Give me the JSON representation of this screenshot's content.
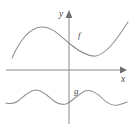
{
  "figure": {
    "background_color": "#ffffff",
    "axis_color": "#8a8a8a",
    "curve_color": "#8f8f8f",
    "label_color": "#4a4a4a",
    "axes": {
      "x_axis_label": "x",
      "y_axis_label": "y",
      "origin_x": 69,
      "origin_y": 70,
      "x_axis_y": 70,
      "x_axis_start": 6,
      "x_axis_end": 126,
      "y_axis_x": 69,
      "y_axis_start": 10,
      "y_axis_end": 124,
      "x_arrow": "right",
      "y_arrow": "up",
      "gridlines": false,
      "tick_labels": []
    },
    "labels": {
      "f_label": "f",
      "f_label_x": 78,
      "f_label_y": 38,
      "g_label": "g",
      "g_label_x": 74,
      "g_label_y": 94,
      "x_label_x": 121,
      "x_label_y": 82,
      "y_label_x": 59,
      "y_label_y": 17
    }
  },
  "chart_data": {
    "type": "line",
    "xlabel": "x",
    "ylabel": "y",
    "grid": false,
    "legend_position": "inline-curve-labels",
    "annotations": [
      {
        "text": "f",
        "x": 78,
        "y": 38,
        "describes": "upper wavy curve crossing near the y-axis"
      },
      {
        "text": "g",
        "x": 74,
        "y": 94,
        "describes": "lower periodic wave entirely below the x-axis"
      }
    ],
    "series": [
      {
        "name": "f",
        "description": "Smooth curve rising from lower left to a local maximum, dipping to a local minimum right of the y-axis, then rising to the upper right. Lies entirely above the x-axis.",
        "path": "M 12,58 C 20,40 30,28 41,27 C 52,26 60,36 70,44 C 80,52 88,57 96,56 C 105,54 114,44 128,22",
        "points": [
          {
            "x": 12,
            "y": 58
          },
          {
            "x": 22,
            "y": 40
          },
          {
            "x": 32,
            "y": 29
          },
          {
            "x": 41,
            "y": 27
          },
          {
            "x": 52,
            "y": 31
          },
          {
            "x": 62,
            "y": 39
          },
          {
            "x": 70,
            "y": 44
          },
          {
            "x": 80,
            "y": 51
          },
          {
            "x": 89,
            "y": 56
          },
          {
            "x": 97,
            "y": 56
          },
          {
            "x": 107,
            "y": 50
          },
          {
            "x": 117,
            "y": 38
          },
          {
            "x": 128,
            "y": 22
          }
        ]
      },
      {
        "name": "g",
        "description": "Periodic wavy curve below the x-axis with crests near x=36 and x=91 and troughs near x=10, x=64 and x=118.",
        "path": "M 6,103 C 10,104 14,104 18,101 C 24,96 30,90 36,90 C 42,90 48,96 54,101 C 58,104 62,105 66,104 C 72,102 78,94 85,91 C 91,89 97,93 103,99 C 108,104 113,106 118,105 C 122,104 125,103 127,102",
        "points": [
          {
            "x": 6,
            "y": 103
          },
          {
            "x": 12,
            "y": 104
          },
          {
            "x": 20,
            "y": 99
          },
          {
            "x": 28,
            "y": 92
          },
          {
            "x": 36,
            "y": 90
          },
          {
            "x": 45,
            "y": 94
          },
          {
            "x": 54,
            "y": 101
          },
          {
            "x": 64,
            "y": 104
          },
          {
            "x": 73,
            "y": 99
          },
          {
            "x": 82,
            "y": 92
          },
          {
            "x": 91,
            "y": 90
          },
          {
            "x": 100,
            "y": 96
          },
          {
            "x": 109,
            "y": 103
          },
          {
            "x": 118,
            "y": 105
          },
          {
            "x": 127,
            "y": 102
          }
        ]
      }
    ]
  }
}
